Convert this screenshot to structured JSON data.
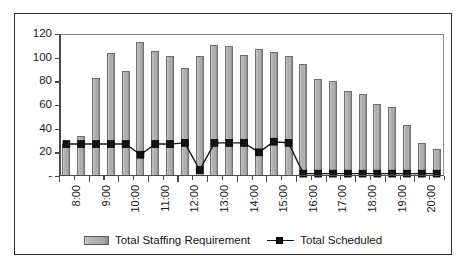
{
  "chart_data": {
    "type": "bar",
    "title": "",
    "xlabel": "",
    "ylabel": "",
    "ylim": [
      0,
      120
    ],
    "ytick_values": [
      0,
      20,
      40,
      60,
      80,
      100,
      120
    ],
    "ytick_labels": [
      "-",
      "20",
      "40",
      "60",
      "80",
      "100",
      "120"
    ],
    "grid": false,
    "legend_position": "bottom",
    "x": [
      "8:00",
      "8:30",
      "9:00",
      "9:30",
      "10:00",
      "10:30",
      "11:00",
      "11:30",
      "12:00",
      "12:30",
      "13:00",
      "13:30",
      "14:00",
      "14:30",
      "15:00",
      "15:30",
      "16:00",
      "16:30",
      "17:00",
      "17:30",
      "18:00",
      "18:30",
      "19:00",
      "19:30",
      "20:00",
      "20:30"
    ],
    "xtick_labels": [
      "8:00",
      "9:00",
      "10:00",
      "11:00",
      "12:00",
      "13:00",
      "14:00",
      "15:00",
      "16:00",
      "17:00",
      "18:00",
      "19:00",
      "20:00"
    ],
    "xtick_label_indices": [
      0,
      2,
      4,
      6,
      8,
      10,
      12,
      14,
      16,
      18,
      20,
      22,
      24
    ],
    "series": [
      {
        "name": "Total Staffing Requirement",
        "type": "bar",
        "color": "#a9a9a9",
        "values": [
          27,
          34,
          83,
          104,
          89,
          113,
          106,
          101,
          91,
          101,
          111,
          110,
          102,
          107,
          105,
          101,
          95,
          82,
          80,
          72,
          69,
          61,
          58,
          43,
          28,
          23
        ]
      },
      {
        "name": "Total Scheduled",
        "type": "line",
        "color": "#141414",
        "marker": "square",
        "values": [
          27,
          27,
          27,
          27,
          27,
          18,
          27,
          27,
          28,
          5,
          28,
          28,
          28,
          20,
          29,
          28,
          2,
          2,
          2,
          2,
          2,
          2,
          2,
          2,
          2,
          2
        ]
      }
    ]
  },
  "legend": {
    "items": [
      {
        "label": "Total Staffing Requirement",
        "marker": "bar-swatch"
      },
      {
        "label": "Total Scheduled",
        "marker": "line-square-marker"
      }
    ]
  }
}
